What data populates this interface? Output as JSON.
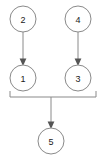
{
  "diagram": {
    "type": "directed-graph",
    "title": "",
    "canvas": {
      "width": 104,
      "height": 157
    },
    "colors": {
      "background": "#ffffff",
      "node_fill": "#ffffff",
      "node_stroke": "#8a8a8a",
      "edge_stroke": "#8a8a8a",
      "arrow_fill": "#555555",
      "label_color": "#1a1a1a"
    },
    "nodes": [
      {
        "id": "n2",
        "label": "2",
        "cx": 23,
        "cy": 19,
        "r": 13
      },
      {
        "id": "n4",
        "label": "4",
        "cx": 78,
        "cy": 19,
        "r": 13
      },
      {
        "id": "n1",
        "label": "1",
        "cx": 23,
        "cy": 78,
        "r": 13
      },
      {
        "id": "n3",
        "label": "3",
        "cx": 78,
        "cy": 78,
        "r": 13
      },
      {
        "id": "n5",
        "label": "5",
        "cx": 51,
        "cy": 141,
        "r": 13
      }
    ],
    "edges": [
      {
        "id": "e-2-1",
        "from": "2",
        "to": "1",
        "arrow": true
      },
      {
        "id": "e-4-3",
        "from": "4",
        "to": "3",
        "arrow": true
      },
      {
        "id": "e-1-join",
        "from": "1",
        "to": "join-bar",
        "arrow": false
      },
      {
        "id": "e-3-join",
        "from": "3",
        "to": "join-bar",
        "arrow": false
      },
      {
        "id": "e-join-5",
        "from": "join-bar",
        "to": "5",
        "arrow": true
      }
    ],
    "join_bar": {
      "y": 97,
      "x_start": 10,
      "x_end": 96
    }
  }
}
